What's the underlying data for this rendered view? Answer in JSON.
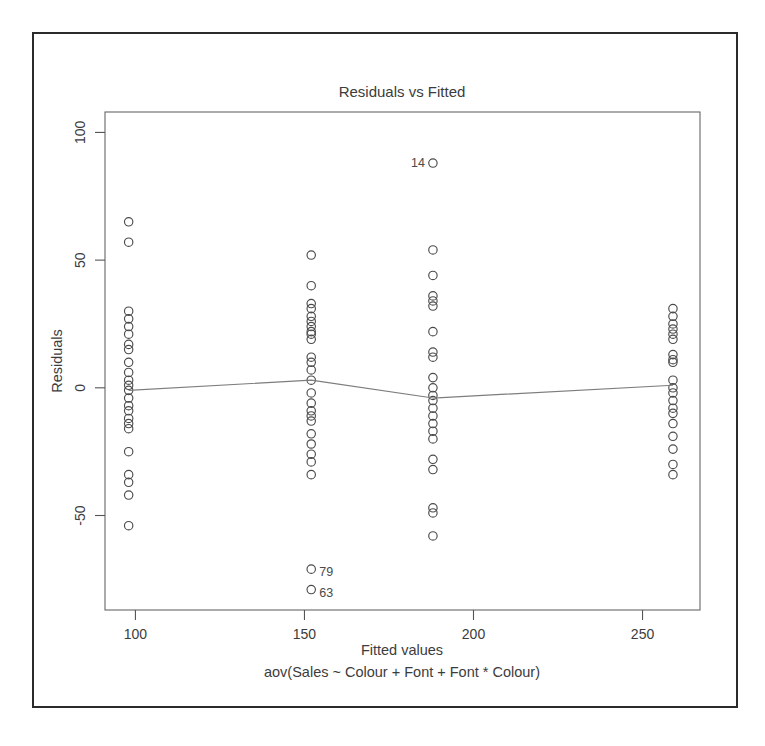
{
  "figure": {
    "title": "Residuals vs Fitted",
    "xlabel": "Fitted values",
    "sublabel": "aov(Sales ~ Colour + Font + Font * Colour)",
    "ylabel": "Residuals"
  },
  "chart_data": {
    "type": "scatter",
    "title": "Residuals vs Fitted",
    "subtitle": "aov(Sales ~ Colour + Font + Font * Colour)",
    "xlabel": "Fitted values",
    "ylabel": "Residuals",
    "xlim": [
      91,
      267
    ],
    "ylim": [
      -87,
      108
    ],
    "xticks": [
      100,
      150,
      200,
      250
    ],
    "yticks": [
      -50,
      0,
      50,
      100
    ],
    "grid": false,
    "legend": null,
    "marker": "open-circle",
    "groups": [
      {
        "fitted": 98,
        "residuals": [
          65,
          57,
          30,
          27,
          24,
          21,
          17,
          15,
          10,
          6,
          3,
          1,
          -1,
          -4,
          -7,
          -9,
          -12,
          -14,
          -16,
          -25,
          -34,
          -37,
          -42,
          -54
        ]
      },
      {
        "fitted": 152,
        "residuals": [
          52,
          40,
          33,
          31,
          28,
          26,
          24,
          22,
          21,
          19,
          12,
          10,
          7,
          3,
          -2,
          -6,
          -9,
          -11,
          -13,
          -18,
          -22,
          -26,
          -29,
          -34,
          -71,
          -79
        ]
      },
      {
        "fitted": 188,
        "residuals": [
          88,
          54,
          44,
          36,
          34,
          32,
          22,
          14,
          12,
          4,
          0,
          -3,
          -5,
          -8,
          -11,
          -14,
          -17,
          -20,
          -28,
          -32,
          -47,
          -49,
          -58
        ]
      },
      {
        "fitted": 259,
        "residuals": [
          31,
          28,
          25,
          23,
          21,
          19,
          13,
          11,
          10,
          3,
          0,
          -2,
          -5,
          -8,
          -10,
          -14,
          -19,
          -24,
          -30,
          -34
        ]
      }
    ],
    "labeled_points": [
      {
        "label": "14",
        "fitted": 188,
        "residual": 88,
        "label_side": "left"
      },
      {
        "label": "79",
        "fitted": 152,
        "residual": -71,
        "label_side": "right"
      },
      {
        "label": "63",
        "fitted": 152,
        "residual": -79,
        "label_side": "right"
      }
    ],
    "trend_line": {
      "name": "lowess",
      "points": [
        {
          "x": 98,
          "y": -1
        },
        {
          "x": 152,
          "y": 3
        },
        {
          "x": 188,
          "y": -4
        },
        {
          "x": 259,
          "y": 1
        }
      ]
    }
  }
}
